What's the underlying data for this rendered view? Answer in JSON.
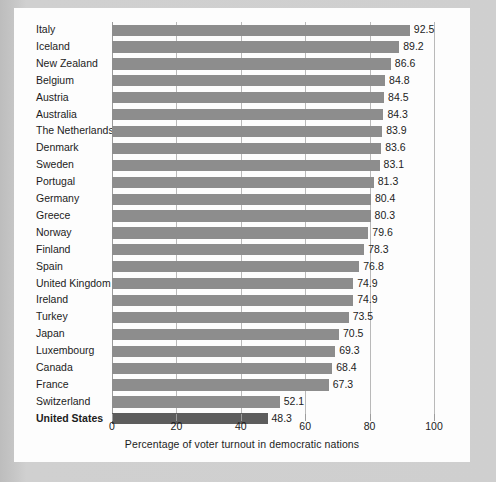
{
  "chart_data": {
    "type": "bar",
    "orientation": "horizontal",
    "title": "",
    "xlabel": "Percentage of voter turnout in democratic nations",
    "ylabel": "",
    "xlim": [
      0,
      100
    ],
    "xticks": [
      0,
      20,
      40,
      60,
      80,
      100
    ],
    "grid": true,
    "legend": "none",
    "bar_color": "#8d8d8d",
    "highlight_color": "#5d5d5d",
    "highlight_category": "United States",
    "categories": [
      "Italy",
      "Iceland",
      "New Zealand",
      "Belgium",
      "Austria",
      "Australia",
      "The Netherlands",
      "Denmark",
      "Sweden",
      "Portugal",
      "Germany",
      "Greece",
      "Norway",
      "Finland",
      "Spain",
      "United Kingdom",
      "Ireland",
      "Turkey",
      "Japan",
      "Luxembourg",
      "Canada",
      "France",
      "Switzerland",
      "United States"
    ],
    "values": [
      92.5,
      89.2,
      86.6,
      84.8,
      84.5,
      84.3,
      83.9,
      83.6,
      83.1,
      81.3,
      80.4,
      80.3,
      79.6,
      78.3,
      76.8,
      74.9,
      74.9,
      73.5,
      70.5,
      69.3,
      68.4,
      67.3,
      52.1,
      48.3
    ],
    "value_labels": [
      "92.5",
      "89.2",
      "86.6",
      "84.8",
      "84.5",
      "84.3",
      "83.9",
      "83.6",
      "83.1",
      "81.3",
      "80.4",
      "80.3",
      "79.6",
      "78.3",
      "76.8",
      "74.9",
      "74.9",
      "73.5",
      "70.5",
      "69.3",
      "68.4",
      "67.3",
      "52.1",
      "48.3"
    ],
    "xtick_labels": [
      "0",
      "20",
      "40",
      "60",
      "80",
      "100"
    ]
  }
}
